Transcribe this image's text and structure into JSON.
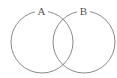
{
  "diagram": {
    "type": "venn",
    "sets": [
      {
        "label": "A",
        "cx": 42,
        "cy": 42,
        "r": 31
      },
      {
        "label": "B",
        "cx": 84,
        "cy": 42,
        "r": 31
      }
    ],
    "colors": {
      "stroke": "#8a8a8a",
      "label": "#555555",
      "background": "#ffffff"
    }
  }
}
